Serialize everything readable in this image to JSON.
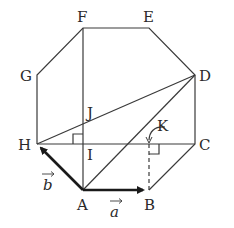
{
  "figure": {
    "type": "regular-octagon-vector-diagram",
    "vertices": {
      "A": {
        "label": "A",
        "x": 83,
        "y": 190
      },
      "B": {
        "label": "B",
        "x": 149,
        "y": 190
      },
      "C": {
        "label": "C",
        "x": 195,
        "y": 144
      },
      "D": {
        "label": "D",
        "x": 195,
        "y": 75
      },
      "E": {
        "label": "E",
        "x": 149,
        "y": 28
      },
      "F": {
        "label": "F",
        "x": 83,
        "y": 28
      },
      "G": {
        "label": "G",
        "x": 37,
        "y": 75
      },
      "H": {
        "label": "H",
        "x": 37,
        "y": 144
      }
    },
    "points": {
      "I": {
        "label": "I",
        "x": 83,
        "y": 144
      },
      "J": {
        "label": "J",
        "x": 83,
        "y": 123
      },
      "K": {
        "label": "K",
        "x": 149,
        "y": 144
      }
    },
    "vectors": {
      "a": {
        "label": "a",
        "from": "A",
        "to": "B"
      },
      "b": {
        "label": "b",
        "from": "A",
        "to": "H"
      }
    },
    "segments": [
      "AB",
      "BC",
      "CD",
      "DE",
      "EF",
      "FG",
      "GH",
      "HA",
      "FA",
      "HC",
      "HD",
      "AD"
    ],
    "dashed_segments": [
      "B-K"
    ],
    "right_angle_marks": [
      "I",
      "K"
    ],
    "colors": {
      "stroke": "#3a3a3a",
      "text": "#2a2a2a",
      "background": "#ffffff"
    }
  }
}
